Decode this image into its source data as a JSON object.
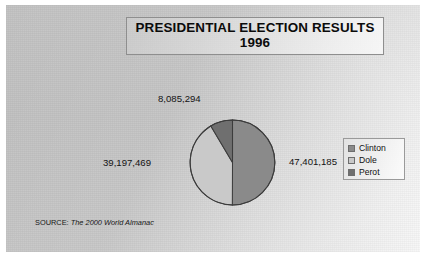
{
  "figure": {
    "title": "PRESIDENTIAL ELECTION RESULTS\n1996",
    "source_prefix": "SOURCE:",
    "source_title": "The 2000 World Almanac"
  },
  "legend": {
    "items": [
      {
        "label": "Clinton",
        "color": "#8a8a8a",
        "swatch_name": "legend-swatch-clinton"
      },
      {
        "label": "Dole",
        "color": "#c9c9c9",
        "swatch_name": "legend-swatch-dole"
      },
      {
        "label": "Perot",
        "color": "#6f6f6f",
        "swatch_name": "legend-swatch-perot"
      }
    ]
  },
  "labels": {
    "clinton_value": "47,401,185",
    "dole_value": "39,197,469",
    "perot_value": "8,085,294"
  },
  "chart_data": {
    "type": "pie",
    "title": "PRESIDENTIAL ELECTION RESULTS 1996",
    "categories": [
      "Clinton",
      "Dole",
      "Perot"
    ],
    "values": [
      47401185,
      39197469,
      8085294
    ],
    "value_labels": [
      "47,401,185",
      "39,197,469",
      "8,085,294"
    ],
    "percentages": [
      50.0,
      41.4,
      8.5
    ],
    "colors": [
      "#8a8a8a",
      "#c9c9c9",
      "#6f6f6f"
    ],
    "start_angle_deg": 0,
    "direction": "clockwise",
    "legend_position": "right",
    "grid": false,
    "xlabel": "",
    "ylabel": "",
    "annotations": [
      "SOURCE: The 2000 World Almanac"
    ]
  }
}
